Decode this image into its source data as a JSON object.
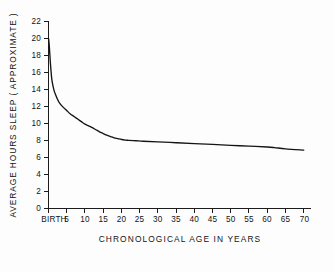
{
  "chart_data": {
    "type": "line",
    "title": "",
    "subtitle": "",
    "xlabel": "CHRONOLOGICAL  AGE   IN  YEARS",
    "ylabel": "AVERAGE  HOURS  SLEEP  ( APPROXIMATE )",
    "xlim": [
      0,
      72
    ],
    "ylim": [
      0,
      22
    ],
    "grid": false,
    "legend": "none",
    "x_tick_values": [
      0,
      5,
      10,
      15,
      20,
      25,
      30,
      35,
      40,
      45,
      50,
      55,
      60,
      65,
      70
    ],
    "x_tick_labels": [
      "BIRTH",
      "5",
      "10",
      "15",
      "20",
      "25",
      "30",
      "35",
      "40",
      "45",
      "50",
      "55",
      "60",
      "65",
      "70"
    ],
    "y_tick_values": [
      0,
      2,
      4,
      6,
      8,
      10,
      12,
      14,
      16,
      18,
      20,
      22
    ],
    "y_tick_labels": [
      "0",
      "2",
      "4",
      "6",
      "8",
      "10",
      "12",
      "14",
      "16",
      "18",
      "20",
      "22"
    ],
    "series": [
      {
        "name": "Average hours of sleep",
        "color": "#141414",
        "x": [
          0,
          0.2,
          0.5,
          0.8,
          1,
          1.5,
          2,
          2.5,
          3,
          4,
          5,
          6,
          7,
          8,
          9,
          10,
          11,
          12,
          13,
          14,
          15,
          16,
          17,
          18,
          19,
          20,
          21,
          22,
          24,
          26,
          30,
          35,
          40,
          45,
          50,
          55,
          60,
          62,
          65,
          70
        ],
        "values": [
          20,
          19.2,
          17.2,
          15.6,
          14.9,
          13.9,
          13.3,
          12.8,
          12.4,
          11.9,
          11.5,
          11.1,
          10.8,
          10.5,
          10.2,
          9.9,
          9.7,
          9.5,
          9.25,
          9.0,
          8.8,
          8.6,
          8.45,
          8.3,
          8.2,
          8.1,
          8.03,
          8.0,
          7.95,
          7.9,
          7.82,
          7.72,
          7.62,
          7.52,
          7.42,
          7.32,
          7.22,
          7.15,
          7.0,
          6.85
        ]
      }
    ],
    "annotations": []
  },
  "figure": {
    "background_color": "#fdfdfd",
    "line_color": "#141414",
    "axis_color": "#1c1c1c"
  }
}
